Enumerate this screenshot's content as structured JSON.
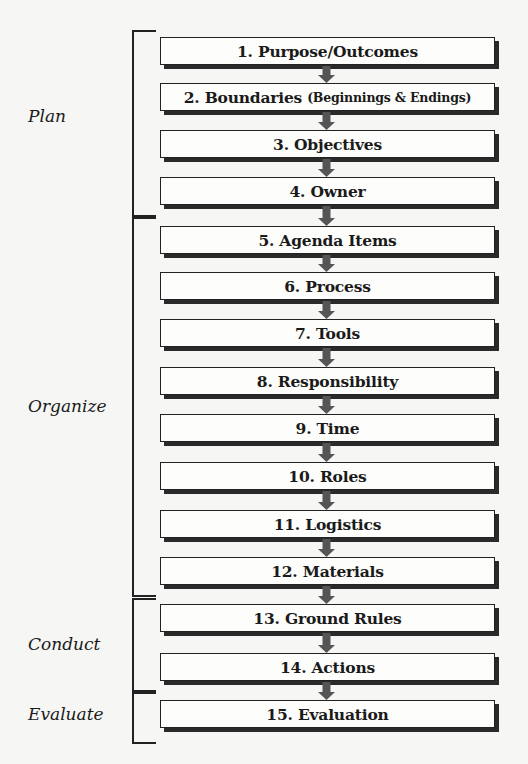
{
  "phases": [
    {
      "label": "Plan",
      "top": 30,
      "bottom": 213,
      "label_y": 106
    },
    {
      "label": "Organize",
      "top": 217,
      "bottom": 593,
      "label_y": 396
    },
    {
      "label": "Conduct",
      "top": 598,
      "bottom": 688,
      "label_y": 634
    },
    {
      "label": "Evaluate",
      "top": 692,
      "bottom": 740,
      "label_y": 704
    }
  ],
  "steps": [
    {
      "label": "1. Purpose/Outcomes",
      "sub": "",
      "top": 37
    },
    {
      "label": "2. Boundaries",
      "sub": "(Beginnings & Endings)",
      "top": 83
    },
    {
      "label": "3. Objectives",
      "sub": "",
      "top": 130
    },
    {
      "label": "4. Owner",
      "sub": "",
      "top": 177
    },
    {
      "label": "5. Agenda Items",
      "sub": "",
      "top": 226
    },
    {
      "label": "6. Process",
      "sub": "",
      "top": 272
    },
    {
      "label": "7. Tools",
      "sub": "",
      "top": 319
    },
    {
      "label": "8. Responsibility",
      "sub": "",
      "top": 367
    },
    {
      "label": "9. Time",
      "sub": "",
      "top": 414
    },
    {
      "label": "10. Roles",
      "sub": "",
      "top": 462
    },
    {
      "label": "11. Logistics",
      "sub": "",
      "top": 510
    },
    {
      "label": "12. Materials",
      "sub": "",
      "top": 557
    },
    {
      "label": "13. Ground Rules",
      "sub": "",
      "top": 604
    },
    {
      "label": "14. Actions",
      "sub": "",
      "top": 653
    },
    {
      "label": "15. Evaluation",
      "sub": "",
      "top": 700
    }
  ],
  "colors": {
    "arrow": "#555555",
    "box_border": "#222222",
    "shadow": "#2a2a2a"
  }
}
